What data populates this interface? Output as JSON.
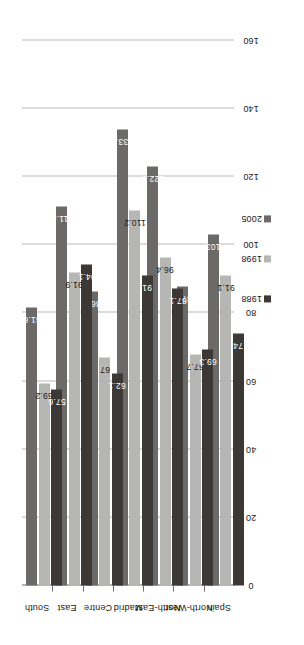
{
  "chart_data": {
    "type": "bar",
    "orientation": "horizontal",
    "title": "",
    "subtitle": "",
    "xlabel": "",
    "ylabel": "",
    "categories": [
      "Spain",
      "North-West",
      "North-East",
      "Madrid",
      "Centre",
      "East",
      "South"
    ],
    "series": [
      {
        "name": "1988",
        "color": "#3b3836",
        "values": [
          74,
          69.3,
          87.1,
          91,
          62.1,
          94.1,
          57.6
        ]
      },
      {
        "name": "1998",
        "color": "#b6b6b4",
        "values": [
          91.1,
          67.7,
          96.4,
          110.2,
          67,
          91.9,
          59.2
        ]
      },
      {
        "name": "2005",
        "color": "#6b6a68",
        "values": [
          103,
          87.8,
          122.9,
          133.9,
          86.3,
          111.4,
          81.6
        ]
      }
    ],
    "value_labels": {
      "1988": [
        "74",
        "69.3",
        "87.1",
        "91",
        "62.1",
        "94.1",
        "57.6"
      ],
      "1998": [
        "91.1",
        "67.7",
        "96.4",
        "110.2",
        "67",
        "91.9",
        "59.2"
      ],
      "2005": [
        "103",
        "87.8",
        "122.9",
        "133.9",
        "86.3",
        "111.4",
        "81.6"
      ]
    },
    "ticks": [
      0,
      20,
      40,
      60,
      80,
      100,
      120,
      140,
      160
    ],
    "tick_labels": [
      "0",
      "20",
      "40",
      "60",
      "80",
      "100",
      "120",
      "140",
      "160"
    ],
    "xlim": [
      0,
      160
    ],
    "grid": true,
    "legend": {
      "position": "bottom-right",
      "entries": [
        {
          "label": "1988",
          "color": "#3b3836"
        },
        {
          "label": "1998",
          "color": "#b6b6b4"
        },
        {
          "label": "2005",
          "color": "#6b6a68"
        }
      ]
    },
    "colors": {
      "gridline": "#b9b9b9",
      "axis": "#6d6d6d",
      "background": "#ffffff",
      "text": "#1a1a1a"
    }
  }
}
